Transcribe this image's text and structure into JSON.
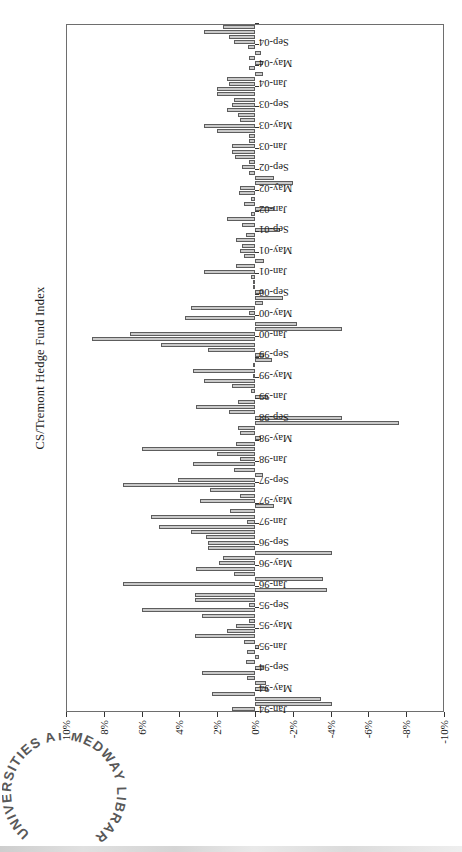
{
  "page": {
    "background": "#ffffff"
  },
  "stamp": {
    "text": "UNIVERSITIES AT MEDWAY LIBRARY",
    "ink_color": "#474747"
  },
  "chart_data": {
    "type": "bar",
    "title": "CS/Tremont Hedge Fund Index",
    "xlabel": "",
    "ylabel": "",
    "ylim": [
      -10,
      10
    ],
    "grid": "dashed horizontal every 2%",
    "legend": "none",
    "orientation": "column chart rotated 90deg CCW on page",
    "bar_color": "#c9c9c9",
    "bar_border_color": "#5d5d5d",
    "y_tick_values": [
      10,
      8,
      6,
      4,
      2,
      0,
      -2,
      -4,
      -6,
      -8,
      -10
    ],
    "y_tick_labels": [
      "10%",
      "8%",
      "6%",
      "4%",
      "2%",
      "0%",
      "-2%",
      "-4%",
      "-6%",
      "-8%",
      "-10%"
    ],
    "x_tick_labels": [
      "Jan-94",
      "May-94",
      "Sep-94",
      "Jan-95",
      "May-95",
      "Sep-95",
      "Jan-96",
      "May-96",
      "Sep-96",
      "Jan-97",
      "May-97",
      "Sep-97",
      "Jan-98",
      "May-98",
      "Sep-98",
      "Jan-99",
      "May-99",
      "Sep-99",
      "Jan-00",
      "May-00",
      "Sep-00",
      "Jan-01",
      "May-01",
      "Sep-01",
      "Jan-02",
      "May-02",
      "Sep-02",
      "Jan-03",
      "May-03",
      "Sep-03",
      "Jan-04",
      "May-04",
      "Sep-04"
    ],
    "x_tick_interval_months": 4,
    "categories": [
      "Jan-94",
      "Feb-94",
      "Mar-94",
      "Apr-94",
      "May-94",
      "Jun-94",
      "Jul-94",
      "Aug-94",
      "Sep-94",
      "Oct-94",
      "Nov-94",
      "Dec-94",
      "Jan-95",
      "Feb-95",
      "Mar-95",
      "Apr-95",
      "May-95",
      "Jun-95",
      "Jul-95",
      "Aug-95",
      "Sep-95",
      "Oct-95",
      "Nov-95",
      "Dec-95",
      "Jan-96",
      "Feb-96",
      "Mar-96",
      "Apr-96",
      "May-96",
      "Jun-96",
      "Jul-96",
      "Aug-96",
      "Sep-96",
      "Oct-96",
      "Nov-96",
      "Dec-96",
      "Jan-97",
      "Feb-97",
      "Mar-97",
      "Apr-97",
      "May-97",
      "Jun-97",
      "Jul-97",
      "Aug-97",
      "Sep-97",
      "Oct-97",
      "Nov-97",
      "Dec-97",
      "Jan-98",
      "Feb-98",
      "Mar-98",
      "Apr-98",
      "May-98",
      "Jun-98",
      "Jul-98",
      "Aug-98",
      "Sep-98",
      "Oct-98",
      "Nov-98",
      "Dec-98",
      "Jan-99",
      "Feb-99",
      "Mar-99",
      "Apr-99",
      "May-99",
      "Jun-99",
      "Jul-99",
      "Aug-99",
      "Sep-99",
      "Oct-99",
      "Nov-99",
      "Dec-99",
      "Jan-00",
      "Feb-00",
      "Mar-00",
      "Apr-00",
      "May-00",
      "Jun-00",
      "Jul-00",
      "Aug-00",
      "Sep-00",
      "Oct-00",
      "Nov-00",
      "Dec-00",
      "Jan-01",
      "Feb-01",
      "Mar-01",
      "Apr-01",
      "May-01",
      "Jun-01",
      "Jul-01",
      "Aug-01",
      "Sep-01",
      "Oct-01",
      "Nov-01",
      "Dec-01",
      "Jan-02",
      "Feb-02",
      "Mar-02",
      "Apr-02",
      "May-02",
      "Jun-02",
      "Jul-02",
      "Aug-02",
      "Sep-02",
      "Oct-02",
      "Nov-02",
      "Dec-02",
      "Jan-03",
      "Feb-03",
      "Mar-03",
      "Apr-03",
      "May-03",
      "Jun-03",
      "Jul-03",
      "Aug-03",
      "Sep-03",
      "Oct-03",
      "Nov-03",
      "Dec-03",
      "Jan-04",
      "Feb-04",
      "Mar-04",
      "Apr-04",
      "May-04",
      "Jun-04",
      "Jul-04",
      "Aug-04",
      "Sep-04",
      "Oct-04",
      "Nov-04",
      "Dec-04"
    ],
    "values": [
      1.2,
      -4.1,
      -3.5,
      2.3,
      -0.7,
      -0.6,
      0.4,
      2.8,
      -0.5,
      0.5,
      -0.2,
      0.4,
      -0.2,
      0.6,
      3.2,
      1.5,
      1.0,
      0.3,
      2.8,
      6.0,
      0.3,
      3.2,
      3.2,
      -3.8,
      7.0,
      -3.6,
      1.1,
      3.1,
      1.9,
      1.7,
      -4.1,
      2.5,
      2.5,
      2.6,
      3.4,
      5.1,
      0.4,
      5.5,
      1.3,
      -1.0,
      2.9,
      0.8,
      2.4,
      7.0,
      4.1,
      -0.4,
      1.1,
      3.3,
      0.8,
      2.0,
      6.0,
      1.0,
      -0.3,
      0.8,
      0.9,
      -7.6,
      -4.6,
      1.4,
      3.1,
      0.9,
      -0.7,
      0.2,
      1.2,
      2.7,
      0.1,
      3.3,
      0.1,
      -0.9,
      -0.5,
      2.5,
      5.0,
      8.6,
      6.6,
      -4.6,
      -2.2,
      3.7,
      0.3,
      3.4,
      -0.4,
      -1.5,
      -0.4,
      0.1,
      0.1,
      0.2,
      2.7,
      1.0,
      -0.5,
      0.6,
      0.8,
      0.7,
      1.0,
      0.5,
      -1.3,
      0.7,
      1.5,
      0.2,
      -1.0,
      0.6,
      0.2,
      0.85,
      0.8,
      -2.0,
      -1.0,
      0.3,
      0.7,
      0.3,
      1.05,
      1.2,
      1.2,
      0.3,
      0.3,
      2.0,
      2.7,
      0.8,
      0.9,
      1.5,
      1.2,
      1.1,
      2.0,
      2.0,
      1.4,
      1.5,
      -0.4,
      0.3,
      -0.4,
      0.3,
      -0.3,
      0.35,
      1.1,
      1.4,
      2.7,
      1.7
    ]
  }
}
